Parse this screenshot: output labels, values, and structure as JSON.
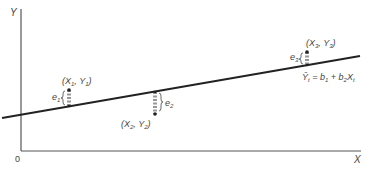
{
  "diagram": {
    "type": "regression-residuals",
    "axes": {
      "y_label": "Y",
      "x_label": "X",
      "origin_label": "0"
    },
    "regression_line": {
      "equation_parts": {
        "lhs": "Ŷ",
        "lhs_sub": "t",
        "eq": " = b",
        "b1_sub": "1",
        "plus": " + b",
        "b2_sub": "2",
        "x": "X",
        "x_sub": "t"
      }
    },
    "points": [
      {
        "label_open": "(X",
        "x_sub": "1",
        "comma": ", Y",
        "y_sub": "1",
        "close": ")",
        "residual": "e",
        "residual_sub": "1"
      },
      {
        "label_open": "(X",
        "x_sub": "2",
        "comma": ", Y",
        "y_sub": "2",
        "close": ")",
        "residual": "e",
        "residual_sub": "2"
      },
      {
        "label_open": "(X",
        "x_sub": "3",
        "comma": ", Y",
        "y_sub": "3",
        "close": ")",
        "residual": "e",
        "residual_sub": "3"
      }
    ],
    "colors": {
      "line": "#222222",
      "axis": "#444444",
      "text": "#444444"
    }
  }
}
